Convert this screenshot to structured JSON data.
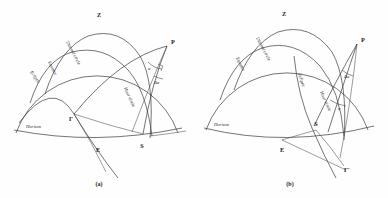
{
  "figure": {
    "background_color": "#fefefe",
    "line_color": "#3a3a3a",
    "panels": [
      {
        "id": "a",
        "caption": "(a)",
        "points": [
          {
            "name": "zenith",
            "label": "Z"
          },
          {
            "name": "pole",
            "label": "P"
          },
          {
            "name": "east",
            "label": "E"
          },
          {
            "name": "star",
            "label": "S"
          },
          {
            "name": "vernal-equinox",
            "label": "Γ"
          }
        ],
        "curves": [
          {
            "name": "horizon",
            "label": "Horizon"
          },
          {
            "name": "ecliptic",
            "label": "Ecliptic"
          },
          {
            "name": "equator",
            "label": "Equator"
          },
          {
            "name": "diurnal-circle",
            "label": "Diurnal circle"
          },
          {
            "name": "hour-circle",
            "label": "Hour circle"
          }
        ],
        "angles": [
          {
            "name": "right-ascension",
            "label": "α"
          },
          {
            "name": "delta-right-ascension",
            "label": "Δα"
          }
        ]
      },
      {
        "id": "b",
        "caption": "(b)",
        "points": [
          {
            "name": "zenith",
            "label": "Z"
          },
          {
            "name": "pole",
            "label": "P"
          },
          {
            "name": "east",
            "label": "E"
          },
          {
            "name": "star",
            "label": "S"
          },
          {
            "name": "vernal-equinox-prime",
            "label": "Γ′"
          }
        ],
        "curves": [
          {
            "name": "horizon",
            "label": "Horizon"
          },
          {
            "name": "equator",
            "label": "Equator"
          },
          {
            "name": "diurnal-circle",
            "label": "Diurnal circle"
          },
          {
            "name": "ecliptic",
            "label": "Ecliptic"
          },
          {
            "name": "hour-circle",
            "label": "Hour circle"
          }
        ],
        "angles": [
          {
            "name": "right-ascension",
            "label": "α"
          },
          {
            "name": "delta-right-ascension",
            "label": "Δα"
          }
        ]
      }
    ]
  }
}
